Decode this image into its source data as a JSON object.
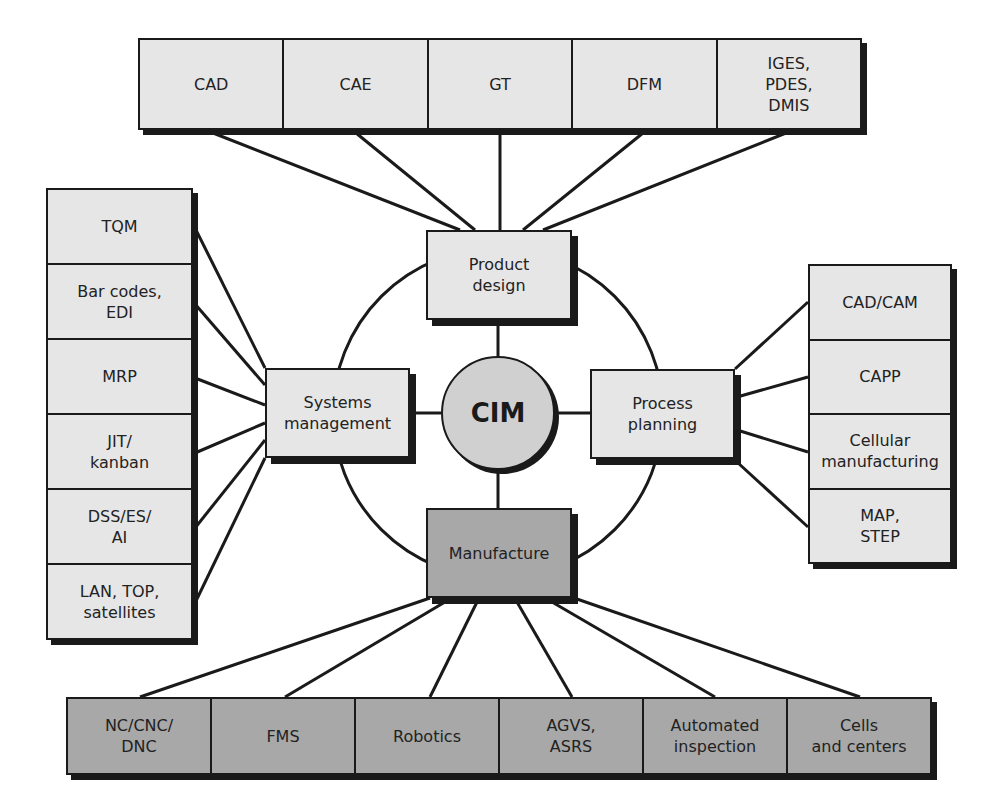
{
  "center": {
    "label": "CIM"
  },
  "hubs": {
    "product_design": "Product\ndesign",
    "systems_management": "Systems\nmanagement",
    "process_planning": "Process\nplanning",
    "manufacture": "Manufacture"
  },
  "top_row": [
    "CAD",
    "CAE",
    "GT",
    "DFM",
    "IGES,\nPDES,\nDMIS"
  ],
  "left_column": [
    "TQM",
    "Bar codes,\nEDI",
    "MRP",
    "JIT/\nkanban",
    "DSS/ES/\nAI",
    "LAN, TOP,\nsatellites"
  ],
  "right_column": [
    "CAD/CAM",
    "CAPP",
    "Cellular\nmanufacturing",
    "MAP,\nSTEP"
  ],
  "bottom_row": [
    "NC/CNC/\nDNC",
    "FMS",
    "Robotics",
    "AGVS,\nASRS",
    "Automated\ninspection",
    "Cells\nand centers"
  ],
  "colors": {
    "light_fill": "#e6e6e6",
    "dark_fill": "#a8a8a8",
    "line": "#1a1a1a",
    "circle_fill": "#d0d0d0"
  }
}
